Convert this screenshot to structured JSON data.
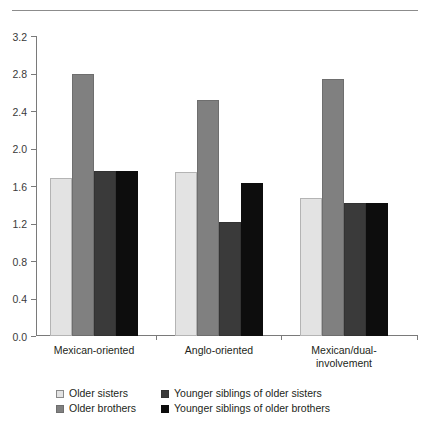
{
  "chart_data": {
    "type": "bar",
    "title": "",
    "subtitle": "",
    "xlabel": "",
    "ylabel": "",
    "ylim": [
      0.0,
      3.2
    ],
    "ytick_labels": [
      "0.0",
      "0.4",
      "0.8",
      "1.2",
      "1.6",
      "2.0",
      "2.4",
      "2.8",
      "3.2"
    ],
    "ytick_values": [
      0.0,
      0.4,
      0.8,
      1.2,
      1.6,
      2.0,
      2.4,
      2.8,
      3.2
    ],
    "grid": false,
    "legend_position": "bottom",
    "categories": [
      "Mexican-oriented",
      "Anglo-oriented",
      "Mexican/dual-\ninvolvement"
    ],
    "series": [
      {
        "name": "Older sisters",
        "color": "#e3e3e3",
        "values": [
          1.69,
          1.75,
          1.47
        ]
      },
      {
        "name": "Older brothers",
        "color": "#808080",
        "values": [
          2.79,
          2.52,
          2.74
        ]
      },
      {
        "name": "Younger siblings of older sisters",
        "color": "#3a3a3a",
        "values": [
          1.76,
          1.22,
          1.42
        ]
      },
      {
        "name": "Younger siblings of older brothers",
        "color": "#0d0d0d",
        "values": [
          1.76,
          1.63,
          1.42
        ]
      }
    ]
  }
}
